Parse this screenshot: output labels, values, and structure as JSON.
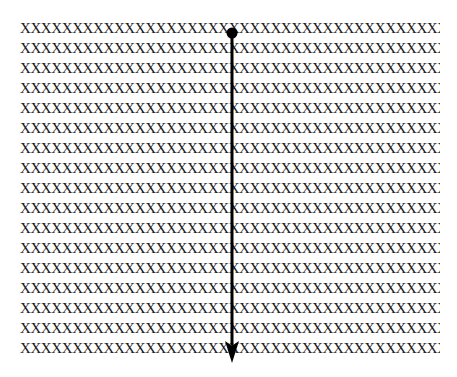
{
  "canvas": {
    "width": 457,
    "height": 377,
    "background": "#ffffff"
  },
  "figure": {
    "text_fill": {
      "character": "X",
      "characters_per_row": 56,
      "row_count": 17,
      "color": "#1a1a1a",
      "rows": [
        "XXXXXXXXXXXXXXXXXXXXXXXXXXXXXXXXXXXXXXXXXXXXXXXXXXXXXXXX",
        "XXXXXXXXXXXXXXXXXXXXXXXXXXXXXXXXXXXXXXXXXXXXXXXXXXXXXXXX",
        "XXXXXXXXXXXXXXXXXXXXXXXXXXXXXXXXXXXXXXXXXXXXXXXXXXXXXXXX",
        "XXXXXXXXXXXXXXXXXXXXXXXXXXXXXXXXXXXXXXXXXXXXXXXXXXXXXXXX",
        "XXXXXXXXXXXXXXXXXXXXXXXXXXXXXXXXXXXXXXXXXXXXXXXXXXXXXXXX",
        "XXXXXXXXXXXXXXXXXXXXXXXXXXXXXXXXXXXXXXXXXXXXXXXXXXXXXXXX",
        "XXXXXXXXXXXXXXXXXXXXXXXXXXXXXXXXXXXXXXXXXXXXXXXXXXXXXXXX",
        "XXXXXXXXXXXXXXXXXXXXXXXXXXXXXXXXXXXXXXXXXXXXXXXXXXXXXXXX",
        "XXXXXXXXXXXXXXXXXXXXXXXXXXXXXXXXXXXXXXXXXXXXXXXXXXXXXXXX",
        "XXXXXXXXXXXXXXXXXXXXXXXXXXXXXXXXXXXXXXXXXXXXXXXXXXXXXXXX",
        "XXXXXXXXXXXXXXXXXXXXXXXXXXXXXXXXXXXXXXXXXXXXXXXXXXXXXXXX",
        "XXXXXXXXXXXXXXXXXXXXXXXXXXXXXXXXXXXXXXXXXXXXXXXXXXXXXXXX",
        "XXXXXXXXXXXXXXXXXXXXXXXXXXXXXXXXXXXXXXXXXXXXXXXXXXXXXXXX",
        "XXXXXXXXXXXXXXXXXXXXXXXXXXXXXXXXXXXXXXXXXXXXXXXXXXXXXXXX",
        "XXXXXXXXXXXXXXXXXXXXXXXXXXXXXXXXXXXXXXXXXXXXXXXXXXXXXXXX",
        "XXXXXXXXXXXXXXXXXXXXXXXXXXXXXXXXXXXXXXXXXXXXXXXXXXXXXXXX",
        "XXXXXXXXXXXXXXXXXXXXXXXXXXXXXXXXXXXXXXXXXXXXXXXXXXXXXXXX"
      ]
    },
    "arrow": {
      "name": "downward-arrow",
      "color": "#000000",
      "x": 232,
      "start_y": 33,
      "end_y": 363,
      "line_width": 3,
      "start_marker": "filled-circle",
      "start_marker_radius": 5.5,
      "end_marker": "filled-triangle",
      "end_marker_width": 14,
      "end_marker_height": 22
    }
  }
}
